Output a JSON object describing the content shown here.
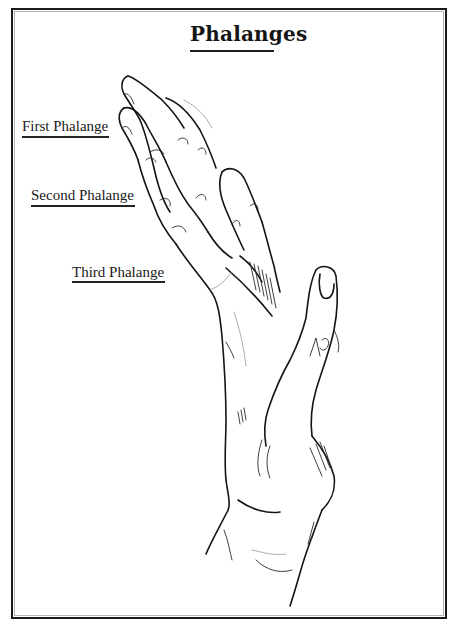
{
  "diagram": {
    "title": "Phalanges",
    "labels": [
      {
        "id": "first",
        "text": "First Phalange"
      },
      {
        "id": "second",
        "text": "Second Phalange"
      },
      {
        "id": "third",
        "text": "Third Phalange"
      }
    ],
    "thumb_annotation": "ΛP",
    "illustration": "hand-line-drawing",
    "colors": {
      "ink": "#141414",
      "paper": "#ffffff",
      "frame": "#1a1a1a"
    }
  }
}
